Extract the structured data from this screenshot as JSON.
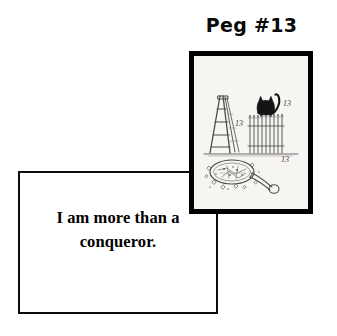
{
  "card": {
    "title": "Peg #13",
    "caption": "I am more than a conqueror.",
    "caption_line_1": "I am more than a",
    "caption_line_2": "conqueror.",
    "background_color": "#ffffff",
    "border_color": "#000000"
  },
  "picture": {
    "alt": "Pen-and-ink drawing of superstition objects: a stepladder, a black cat on a picket fence, and a broken hand mirror",
    "frame_color": "#000000",
    "paper_color": "#f6f5f2",
    "ink_color": "#3a3a3a",
    "elements": [
      {
        "name": "stepladder",
        "label": "13"
      },
      {
        "name": "black-cat",
        "label": "13"
      },
      {
        "name": "picket-fence",
        "label": ""
      },
      {
        "name": "broken-mirror",
        "label": "13"
      }
    ],
    "labels": [
      "13",
      "13",
      "13"
    ]
  }
}
